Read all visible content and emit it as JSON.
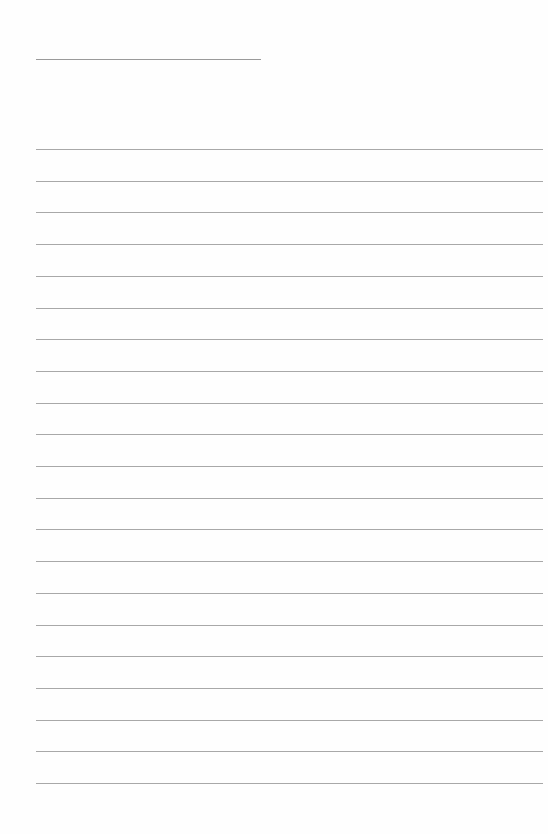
{
  "document": {
    "type": "lined-paper",
    "title_line": {
      "x": 36,
      "y": 59,
      "width": 225
    },
    "rules": {
      "count": 21,
      "x": 36,
      "width": 507,
      "start_y": 149,
      "spacing": 31.7
    },
    "colors": {
      "background": "#fefefe",
      "rule": "#a8a8a8",
      "title_line": "#9a9a9a"
    }
  }
}
